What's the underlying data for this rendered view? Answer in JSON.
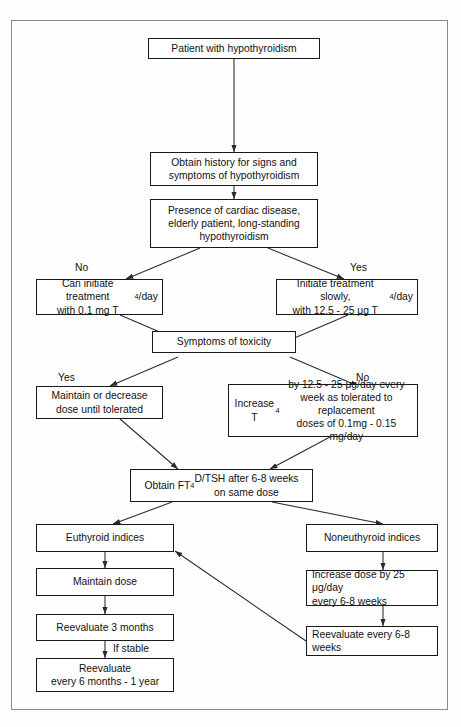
{
  "diagram": {
    "border_color": "#8a8a8a",
    "line_color": "#2b2b2b",
    "nodes": {
      "patient": "Patient with hypothyroidism",
      "history": "Obtain history for signs and<br>symptoms of hypothyroidism",
      "presence": "Presence of cardiac disease,<br>elderly patient, long-standing<br>hypothyroidism",
      "can_initiate": "Can initiate treatment<br>with 0.1 mg T<sub>4</sub>/day",
      "initiate_slowly": "Initiate treatment slowly,<br>with 12.5 - 25 &mu;g T<sub>4</sub>/day",
      "toxicity": "Symptoms of toxicity",
      "maintain_decrease": "Maintain or decrease<br>dose until tolerated",
      "increase_t4": "Increase T<sub>4</sub> by 12.5 - 25 &mu;g/day every<br>week as tolerated to replacement<br>doses of 0.1mg - 0.15 mg/day",
      "obtain_ft4d": "Obtain FT<sub>4</sub>D/TSH after 6-8 weeks<br>on same dose",
      "euthyroid": "Euthyroid indices",
      "noneuthyroid": "Noneuthyroid indices",
      "maintain_dose": "Maintain dose",
      "reevaluate_3mo": "Reevaluate  3 months",
      "reevaluate_6mo": "Reevaluate<br>every 6 months - 1 year",
      "increase_dose_25": "Increase dose by 25 &mu;g/day<br>every 6-8 weeks",
      "reevaluate_68w": "Reevaluate every 6-8 weeks"
    },
    "edge_labels": {
      "no_left": "No",
      "yes_right": "Yes",
      "yes_left": "Yes",
      "no_right": "No",
      "if_stable": "If stable"
    }
  }
}
